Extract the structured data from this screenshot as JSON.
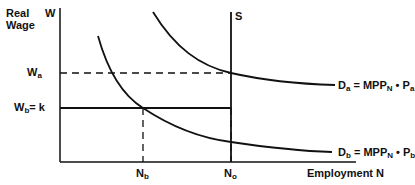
{
  "diagram": {
    "y_axis": {
      "label_line1": "Real",
      "label_line2": "Wage",
      "symbol": "W"
    },
    "x_axis": {
      "label": "Employment N"
    },
    "supply": {
      "label": "S"
    },
    "wage_levels": [
      {
        "id": "Wa",
        "base": "W",
        "sub": "a",
        "suffix": "",
        "style": "dashed"
      },
      {
        "id": "Wb",
        "base": "W",
        "sub": "b",
        "suffix": "= k",
        "style": "solid"
      }
    ],
    "employment_levels": [
      {
        "id": "Nb",
        "base": "N",
        "sub": "b"
      },
      {
        "id": "No",
        "base": "N",
        "sub": "o"
      }
    ],
    "demand_curves": [
      {
        "id": "Da",
        "lhs_base": "D",
        "lhs_sub": "a",
        "eq": " = MPP",
        "mpp_sub": "N",
        "dot": " • P",
        "p_sub": "a"
      },
      {
        "id": "Db",
        "lhs_base": "D",
        "lhs_sub": "b",
        "eq": " = MPP",
        "mpp_sub": "N",
        "dot": " • P",
        "p_sub": "b"
      }
    ]
  }
}
